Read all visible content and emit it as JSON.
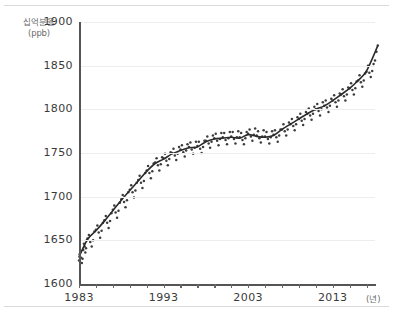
{
  "chart_data": {
    "type": "scatter",
    "title": "",
    "subtitle": "",
    "xlabel": "(년)",
    "ylabel": "십억분율 (ppb)",
    "ylabel_lines": [
      "십억분율",
      "(ppb)"
    ],
    "xlim": [
      1983,
      2018
    ],
    "ylim": [
      1600,
      1900
    ],
    "yticks": [
      1900,
      1850,
      1800,
      1750,
      1700,
      1650,
      1600
    ],
    "ytick_labels": [
      "1900",
      "1850",
      "1800",
      "1750",
      "1700",
      "1650",
      "1600"
    ],
    "xticks": [
      1983,
      1985,
      1987,
      1989,
      1991,
      1993,
      1995,
      1997,
      1999,
      2001,
      2003,
      2005,
      2007,
      2009,
      2011,
      2013,
      2015,
      2017
    ],
    "xtick_labels_shown": [
      "1983",
      "1993",
      "2003",
      "2013"
    ],
    "xtick_labels_shown_values": [
      1983,
      1993,
      2003,
      2013
    ],
    "grid": "horizontal",
    "legend": "none",
    "series": [
      {
        "name": "월별 관측값",
        "style": "dots",
        "color": "#3c3c3c",
        "x": [
          1983.0,
          1983.08,
          1983.17,
          1983.25,
          1983.33,
          1983.42,
          1983.5,
          1983.58,
          1983.67,
          1983.75,
          1983.83,
          1983.92,
          1984.0,
          1984.17,
          1984.33,
          1984.5,
          1984.67,
          1984.83,
          1985.0,
          1985.17,
          1985.33,
          1985.5,
          1985.67,
          1985.83,
          1986.0,
          1986.17,
          1986.33,
          1986.5,
          1986.67,
          1986.83,
          1987.0,
          1987.17,
          1987.33,
          1987.5,
          1987.67,
          1987.83,
          1988.0,
          1988.17,
          1988.33,
          1988.5,
          1988.67,
          1988.83,
          1989.0,
          1989.17,
          1989.33,
          1989.5,
          1989.67,
          1989.83,
          1990.0,
          1990.17,
          1990.33,
          1990.5,
          1990.67,
          1990.83,
          1991.0,
          1991.17,
          1991.33,
          1991.5,
          1991.67,
          1991.83,
          1992.0,
          1992.17,
          1992.33,
          1992.5,
          1992.67,
          1992.83,
          1993.0,
          1993.17,
          1993.33,
          1993.5,
          1993.67,
          1993.83,
          1994.0,
          1994.17,
          1994.33,
          1994.5,
          1994.67,
          1994.83,
          1995.0,
          1995.17,
          1995.33,
          1995.5,
          1995.67,
          1995.83,
          1996.0,
          1996.17,
          1996.33,
          1996.5,
          1996.67,
          1996.83,
          1997.0,
          1997.17,
          1997.33,
          1997.5,
          1997.67,
          1997.83,
          1998.0,
          1998.17,
          1998.33,
          1998.5,
          1998.67,
          1998.83,
          1999.0,
          1999.17,
          1999.33,
          1999.5,
          1999.67,
          1999.83,
          2000.0,
          2000.17,
          2000.33,
          2000.5,
          2000.67,
          2000.83,
          2001.0,
          2001.17,
          2001.33,
          2001.5,
          2001.67,
          2001.83,
          2002.0,
          2002.17,
          2002.33,
          2002.5,
          2002.67,
          2002.83,
          2003.0,
          2003.17,
          2003.33,
          2003.5,
          2003.67,
          2003.83,
          2004.0,
          2004.17,
          2004.33,
          2004.5,
          2004.67,
          2004.83,
          2005.0,
          2005.17,
          2005.33,
          2005.5,
          2005.67,
          2005.83,
          2006.0,
          2006.17,
          2006.33,
          2006.5,
          2006.67,
          2006.83,
          2007.0,
          2007.17,
          2007.33,
          2007.5,
          2007.67,
          2007.83,
          2008.0,
          2008.17,
          2008.33,
          2008.5,
          2008.67,
          2008.83,
          2009.0,
          2009.17,
          2009.33,
          2009.5,
          2009.67,
          2009.83,
          2010.0,
          2010.17,
          2010.33,
          2010.5,
          2010.67,
          2010.83,
          2011.0,
          2011.17,
          2011.33,
          2011.5,
          2011.67,
          2011.83,
          2012.0,
          2012.17,
          2012.33,
          2012.5,
          2012.67,
          2012.83,
          2013.0,
          2013.17,
          2013.33,
          2013.5,
          2013.67,
          2013.83,
          2014.0,
          2014.17,
          2014.33,
          2014.5,
          2014.67,
          2014.83,
          2015.0,
          2015.17,
          2015.33,
          2015.5,
          2015.67,
          2015.83,
          2016.0,
          2016.17,
          2016.33,
          2016.5,
          2016.67,
          2016.83,
          2017.0,
          2017.17,
          2017.33,
          2017.5,
          2017.67,
          2017.83,
          2018.0,
          2018.17,
          2018.33
        ],
        "y": [
          1627,
          1634,
          1638,
          1630,
          1624,
          1629,
          1639,
          1646,
          1643,
          1636,
          1641,
          1650,
          1652,
          1656,
          1648,
          1643,
          1650,
          1660,
          1662,
          1667,
          1659,
          1653,
          1661,
          1670,
          1673,
          1678,
          1670,
          1664,
          1672,
          1681,
          1685,
          1690,
          1682,
          1676,
          1684,
          1693,
          1697,
          1702,
          1694,
          1688,
          1696,
          1705,
          1708,
          1713,
          1705,
          1699,
          1707,
          1716,
          1719,
          1724,
          1716,
          1710,
          1718,
          1727,
          1730,
          1735,
          1727,
          1721,
          1729,
          1738,
          1739,
          1744,
          1736,
          1730,
          1737,
          1745,
          1744,
          1749,
          1741,
          1736,
          1743,
          1751,
          1750,
          1755,
          1747,
          1742,
          1749,
          1757,
          1754,
          1759,
          1751,
          1746,
          1753,
          1760,
          1757,
          1762,
          1754,
          1749,
          1756,
          1763,
          1758,
          1763,
          1755,
          1750,
          1757,
          1764,
          1764,
          1769,
          1761,
          1756,
          1763,
          1770,
          1767,
          1772,
          1764,
          1759,
          1766,
          1773,
          1768,
          1773,
          1765,
          1760,
          1767,
          1774,
          1769,
          1774,
          1766,
          1761,
          1768,
          1775,
          1768,
          1773,
          1765,
          1760,
          1767,
          1774,
          1772,
          1777,
          1769,
          1764,
          1771,
          1778,
          1770,
          1775,
          1767,
          1762,
          1769,
          1776,
          1769,
          1774,
          1766,
          1761,
          1768,
          1775,
          1771,
          1776,
          1768,
          1763,
          1770,
          1777,
          1777,
          1783,
          1775,
          1770,
          1777,
          1785,
          1783,
          1789,
          1781,
          1776,
          1783,
          1791,
          1789,
          1795,
          1787,
          1782,
          1789,
          1797,
          1795,
          1801,
          1793,
          1788,
          1795,
          1803,
          1800,
          1806,
          1798,
          1793,
          1800,
          1808,
          1804,
          1810,
          1802,
          1797,
          1804,
          1812,
          1810,
          1816,
          1808,
          1803,
          1810,
          1818,
          1817,
          1823,
          1815,
          1810,
          1817,
          1825,
          1824,
          1830,
          1822,
          1817,
          1824,
          1832,
          1833,
          1839,
          1831,
          1826,
          1833,
          1841,
          1843,
          1850,
          1842,
          1837,
          1844,
          1852,
          1856,
          1866,
          1873
        ]
      },
      {
        "name": "추세선",
        "style": "line",
        "color": "#2b2b2b",
        "x": [
          1983,
          1984,
          1985,
          1986,
          1987,
          1988,
          1989,
          1990,
          1991,
          1992,
          1993,
          1994,
          1995,
          1996,
          1997,
          1998,
          1999,
          2000,
          2001,
          2002,
          2003,
          2004,
          2005,
          2006,
          2007,
          2008,
          2009,
          2010,
          2011,
          2012,
          2013,
          2014,
          2015,
          2016,
          2017,
          2018.3
        ],
        "y": [
          1631,
          1651,
          1661,
          1672,
          1684,
          1696,
          1707,
          1718,
          1729,
          1738,
          1743,
          1749,
          1753,
          1756,
          1757,
          1763,
          1766,
          1767,
          1768,
          1767,
          1771,
          1769,
          1768,
          1770,
          1777,
          1783,
          1789,
          1795,
          1800,
          1804,
          1810,
          1817,
          1824,
          1833,
          1844,
          1872
        ]
      }
    ]
  }
}
